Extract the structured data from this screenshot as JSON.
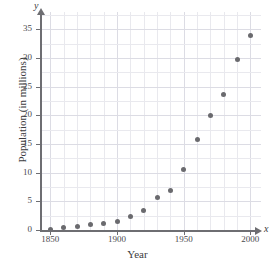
{
  "chart_data": {
    "type": "scatter",
    "title": "",
    "xlabel": "Year",
    "ylabel": "Population (in millions)",
    "x_axis_variable": "x",
    "y_axis_variable": "y",
    "xlim": [
      1843,
      2008
    ],
    "ylim": [
      0,
      38
    ],
    "x_ticks": [
      1850,
      1900,
      1950,
      2000
    ],
    "x_tick_labels": [
      "1850",
      "1900",
      "1950",
      "2000"
    ],
    "y_ticks": [
      0,
      5,
      10,
      15,
      20,
      25,
      30,
      35
    ],
    "y_tick_labels": [
      "0",
      "5",
      "10",
      "15",
      "20",
      "25",
      "30",
      "35"
    ],
    "grid": true,
    "grid_minor_x_step": 10,
    "grid_minor_y_step": 2.5,
    "legend": "none",
    "marker_color": "#6a6a6e",
    "grid_color": "#e9e9ee",
    "axis_color": "#6e6e72",
    "x": [
      1850,
      1860,
      1870,
      1880,
      1890,
      1900,
      1910,
      1920,
      1930,
      1940,
      1950,
      1960,
      1970,
      1980,
      1990,
      2000
    ],
    "y": [
      0.1,
      0.4,
      0.6,
      0.9,
      1.2,
      1.5,
      2.4,
      3.4,
      5.7,
      6.9,
      10.6,
      15.7,
      20.0,
      23.7,
      29.8,
      33.9
    ],
    "values": [
      {
        "year": 1850,
        "population": 0.1
      },
      {
        "year": 1860,
        "population": 0.4
      },
      {
        "year": 1870,
        "population": 0.6
      },
      {
        "year": 1880,
        "population": 0.9
      },
      {
        "year": 1890,
        "population": 1.2
      },
      {
        "year": 1900,
        "population": 1.5
      },
      {
        "year": 1910,
        "population": 2.4
      },
      {
        "year": 1920,
        "population": 3.4
      },
      {
        "year": 1930,
        "population": 5.7
      },
      {
        "year": 1940,
        "population": 6.9
      },
      {
        "year": 1950,
        "population": 10.6
      },
      {
        "year": 1960,
        "population": 15.7
      },
      {
        "year": 1970,
        "population": 20.0
      },
      {
        "year": 1980,
        "population": 23.7
      },
      {
        "year": 1990,
        "population": 29.8
      },
      {
        "year": 2000,
        "population": 33.9
      }
    ]
  }
}
